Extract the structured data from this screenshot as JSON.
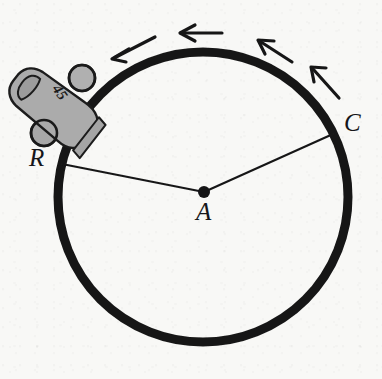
{
  "figure": {
    "background_color": "#f8f8f6",
    "ink_color": "#161618",
    "car_body_color": "#aaaaaa",
    "car_outline_color": "#1a1a1a"
  },
  "track": {
    "name": "circular-track",
    "center_x": 203,
    "center_y": 197,
    "radius": 145,
    "stroke_width": 9,
    "color": "#191919"
  },
  "center_point": {
    "label": "A",
    "x": 204,
    "y": 192,
    "dot_radius": 6
  },
  "points": [
    {
      "label": "R",
      "x": 62,
      "y": 164,
      "label_x": 29,
      "label_y": 145
    },
    {
      "label": "C",
      "x": 333,
      "y": 134,
      "label_x": 344,
      "label_y": 110
    }
  ],
  "radii": [
    {
      "name": "radius-A-to-R",
      "x1": 204,
      "y1": 192,
      "x2": 62,
      "y2": 164
    },
    {
      "name": "radius-A-to-C",
      "x1": 204,
      "y1": 192,
      "x2": 333,
      "y2": 134
    }
  ],
  "direction_arrows": {
    "description": "counterclockwise travel direction",
    "count": 4,
    "items": [
      {
        "name": "direction-arrow-1",
        "x1": 155,
        "y1": 37,
        "x2": 112,
        "y2": 59
      },
      {
        "name": "direction-arrow-2",
        "x1": 222,
        "y1": 33,
        "x2": 180,
        "y2": 33
      },
      {
        "name": "direction-arrow-3",
        "x1": 292,
        "y1": 62,
        "x2": 258,
        "y2": 40
      },
      {
        "name": "direction-arrow-4",
        "x1": 339,
        "y1": 98,
        "x2": 311,
        "y2": 67
      }
    ]
  },
  "car": {
    "name": "race-car",
    "number": "45",
    "number_x": 56,
    "number_y": 95,
    "number_rotation_deg": 55,
    "number_font_size": 13,
    "position_x": 52,
    "position_y": 105,
    "rotation_deg": -52,
    "wheels": [
      {
        "name": "car-wheel-front",
        "cx": 82,
        "cy": 78,
        "r": 13
      },
      {
        "name": "car-wheel-rear",
        "cx": 44,
        "cy": 133,
        "r": 13
      }
    ]
  },
  "labels": {
    "R": "R",
    "A": "A",
    "C": "C"
  }
}
